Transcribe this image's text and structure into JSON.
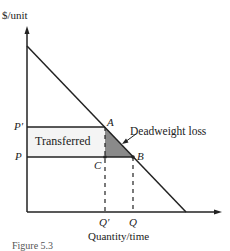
{
  "diagram": {
    "y_axis_label": "$/unit",
    "x_axis_label": "Quantity/time",
    "price_labels": {
      "p_prime": "P′",
      "p": "P"
    },
    "quantity_labels": {
      "q_prime": "Q′",
      "q": "Q"
    },
    "points": {
      "a": "A",
      "b": "B",
      "c": "C"
    },
    "regions": {
      "transferred": "Transferred",
      "deadweight": "Deadweight loss"
    },
    "caption": "Figure 5.3",
    "colors": {
      "line": "#222222",
      "transferred_fill": "#f4f4f4",
      "deadweight_fill": "#8a8a8a"
    }
  }
}
